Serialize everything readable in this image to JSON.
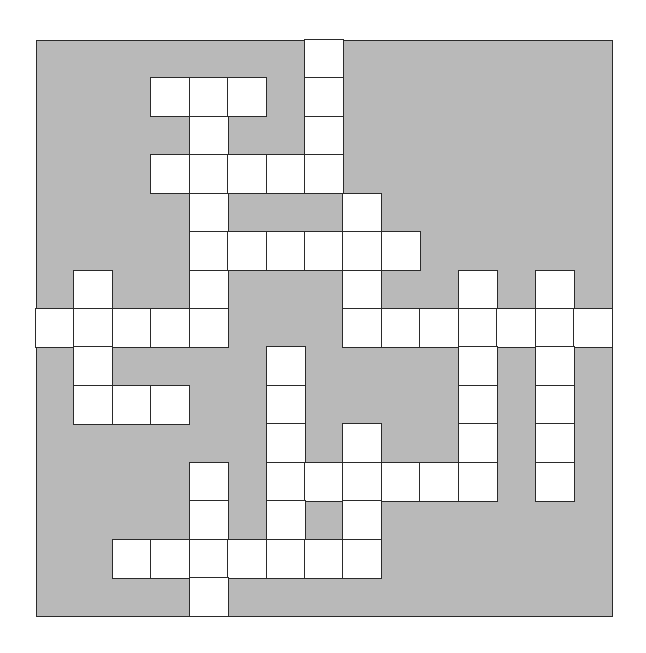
{
  "puzzle": {
    "type": "crossword",
    "rows": 15,
    "cols": 15,
    "colors": {
      "block": "#b9b9b9",
      "cell": "#ffffff",
      "line": "#2a2a2a"
    },
    "white_cells": [
      [
        0,
        7
      ],
      [
        1,
        3
      ],
      [
        1,
        4
      ],
      [
        1,
        5
      ],
      [
        1,
        7
      ],
      [
        2,
        4
      ],
      [
        2,
        7
      ],
      [
        3,
        3
      ],
      [
        3,
        4
      ],
      [
        3,
        5
      ],
      [
        3,
        6
      ],
      [
        3,
        7
      ],
      [
        4,
        4
      ],
      [
        4,
        8
      ],
      [
        5,
        4
      ],
      [
        5,
        5
      ],
      [
        5,
        6
      ],
      [
        5,
        7
      ],
      [
        5,
        8
      ],
      [
        5,
        9
      ],
      [
        6,
        1
      ],
      [
        6,
        4
      ],
      [
        6,
        8
      ],
      [
        6,
        11
      ],
      [
        6,
        13
      ],
      [
        7,
        0
      ],
      [
        7,
        1
      ],
      [
        7,
        2
      ],
      [
        7,
        3
      ],
      [
        7,
        4
      ],
      [
        7,
        8
      ],
      [
        7,
        9
      ],
      [
        7,
        10
      ],
      [
        7,
        11
      ],
      [
        7,
        12
      ],
      [
        7,
        13
      ],
      [
        7,
        14
      ],
      [
        8,
        1
      ],
      [
        8,
        6
      ],
      [
        8,
        11
      ],
      [
        8,
        13
      ],
      [
        9,
        1
      ],
      [
        9,
        2
      ],
      [
        9,
        3
      ],
      [
        9,
        6
      ],
      [
        9,
        11
      ],
      [
        9,
        13
      ],
      [
        10,
        6
      ],
      [
        10,
        8
      ],
      [
        10,
        11
      ],
      [
        10,
        13
      ],
      [
        11,
        4
      ],
      [
        11,
        6
      ],
      [
        11,
        7
      ],
      [
        11,
        8
      ],
      [
        11,
        9
      ],
      [
        11,
        10
      ],
      [
        11,
        11
      ],
      [
        11,
        13
      ],
      [
        12,
        4
      ],
      [
        12,
        6
      ],
      [
        12,
        8
      ],
      [
        13,
        2
      ],
      [
        13,
        3
      ],
      [
        13,
        4
      ],
      [
        13,
        5
      ],
      [
        13,
        6
      ],
      [
        13,
        7
      ],
      [
        13,
        8
      ],
      [
        14,
        4
      ]
    ]
  }
}
